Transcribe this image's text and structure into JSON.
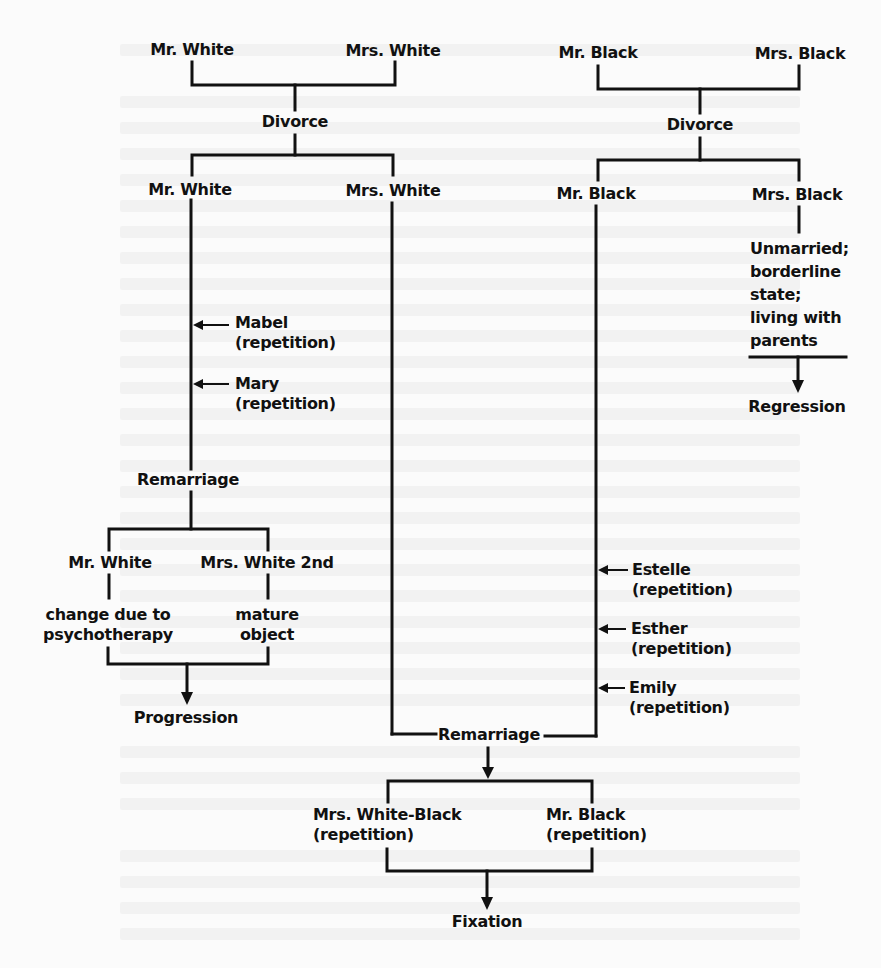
{
  "diagram": {
    "background_color": "#fbfbfb",
    "line_color": "#111111",
    "white_family": {
      "parents": {
        "husband": "Mr. White",
        "wife": "Mrs. White"
      },
      "event_1": "Divorce",
      "after_divorce": {
        "husband": "Mr. White",
        "wife": "Mrs. White"
      },
      "husband_repetitions": [
        {
          "name": "Mabel",
          "note": "(repetition)"
        },
        {
          "name": "Mary",
          "note": "(repetition)"
        }
      ],
      "event_2": "Remarriage",
      "second_marriage": {
        "husband": "Mr. White",
        "husband_note_line1": "change due to",
        "husband_note_line2": "psychotherapy",
        "wife": "Mrs. White 2nd",
        "wife_note_line1": "mature",
        "wife_note_line2": "object"
      },
      "outcome": "Progression"
    },
    "black_family": {
      "parents": {
        "husband": "Mr. Black",
        "wife": "Mrs. Black"
      },
      "event_1": "Divorce",
      "after_divorce": {
        "husband": "Mr. Black",
        "wife": "Mrs. Black"
      },
      "wife_state": {
        "line1": "Unmarried;",
        "line2": "borderline",
        "line3": "state;",
        "line4": "living with",
        "line5": "parents"
      },
      "wife_outcome": "Regression",
      "husband_repetitions": [
        {
          "name": "Estelle",
          "note": "(repetition)"
        },
        {
          "name": "Esther",
          "note": "(repetition)"
        },
        {
          "name": "Emily",
          "note": "(repetition)"
        }
      ]
    },
    "joint": {
      "event": "Remarriage",
      "wife": "Mrs. White-Black",
      "wife_note": "(repetition)",
      "husband": "Mr. Black",
      "husband_note": "(repetition)",
      "outcome": "Fixation"
    }
  }
}
